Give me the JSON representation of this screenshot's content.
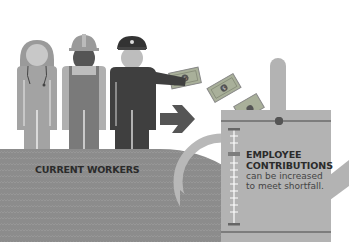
{
  "illustration": {
    "title": "Current workers funding pension contributions",
    "colors": {
      "background": "#ffffff",
      "ground": "#8c8c8c",
      "person_light": "#a8a8a8",
      "person_mid": "#7a7a7a",
      "person_dark": "#3f3f3f",
      "skin": "#c4c4c4",
      "can": "#b3b3b3",
      "can_stripe": "#7d7d7d",
      "arrow": "#555555",
      "money": "#a9b09a",
      "text": "#2b2b2b"
    },
    "figures": [
      {
        "name": "nurse",
        "icon": "nurse-figure"
      },
      {
        "name": "construction-worker",
        "icon": "hardhat-worker-figure"
      },
      {
        "name": "pilot",
        "icon": "pilot-figure"
      }
    ],
    "bills_count": 3,
    "workers_label": "CURRENT WORKERS",
    "contributions": {
      "title_line1": "EMPLOYEE",
      "title_line2": "CONTRIBUTIONS",
      "desc_line1": "can be increased",
      "desc_line2": "to meet shortfall."
    }
  }
}
